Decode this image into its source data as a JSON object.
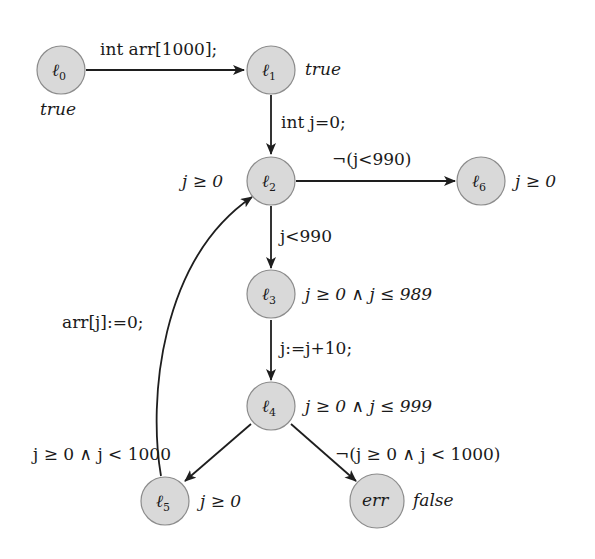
{
  "diagram": {
    "type": "control-flow-automaton",
    "colors": {
      "node_fill": "#d9d9d9",
      "node_stroke": "#8c8c8c",
      "edge": "#1e1e1e",
      "text": "#1a1a1a"
    },
    "nodes": [
      {
        "id": "l0",
        "label": "ℓ",
        "sub": "0",
        "annotation": "true"
      },
      {
        "id": "l1",
        "label": "ℓ",
        "sub": "1",
        "annotation": "true"
      },
      {
        "id": "l2",
        "label": "ℓ",
        "sub": "2",
        "annotation": "j ≥ 0"
      },
      {
        "id": "l6",
        "label": "ℓ",
        "sub": "6",
        "annotation": "j ≥ 0"
      },
      {
        "id": "l3",
        "label": "ℓ",
        "sub": "3",
        "annotation": "j ≥ 0 ∧ j ≤ 989"
      },
      {
        "id": "l4",
        "label": "ℓ",
        "sub": "4",
        "annotation": "j ≥ 0 ∧ j ≤ 999"
      },
      {
        "id": "l5",
        "label": "ℓ",
        "sub": "5",
        "annotation": "j ≥ 0"
      },
      {
        "id": "err",
        "label": "err",
        "sub": "",
        "annotation": "false"
      }
    ],
    "edges": [
      {
        "from": "l0",
        "to": "l1",
        "label": "int arr[1000];"
      },
      {
        "from": "l1",
        "to": "l2",
        "label": "int j=0;"
      },
      {
        "from": "l2",
        "to": "l6",
        "label": "¬(j<990)"
      },
      {
        "from": "l2",
        "to": "l3",
        "label": "j<990"
      },
      {
        "from": "l3",
        "to": "l4",
        "label": "j:=j+10;"
      },
      {
        "from": "l4",
        "to": "l5",
        "label": "j ≥ 0 ∧ j < 1000"
      },
      {
        "from": "l4",
        "to": "err",
        "label": "¬(j ≥ 0 ∧ j < 1000)"
      },
      {
        "from": "l5",
        "to": "l2",
        "label": "arr[j]:=0;"
      }
    ]
  }
}
